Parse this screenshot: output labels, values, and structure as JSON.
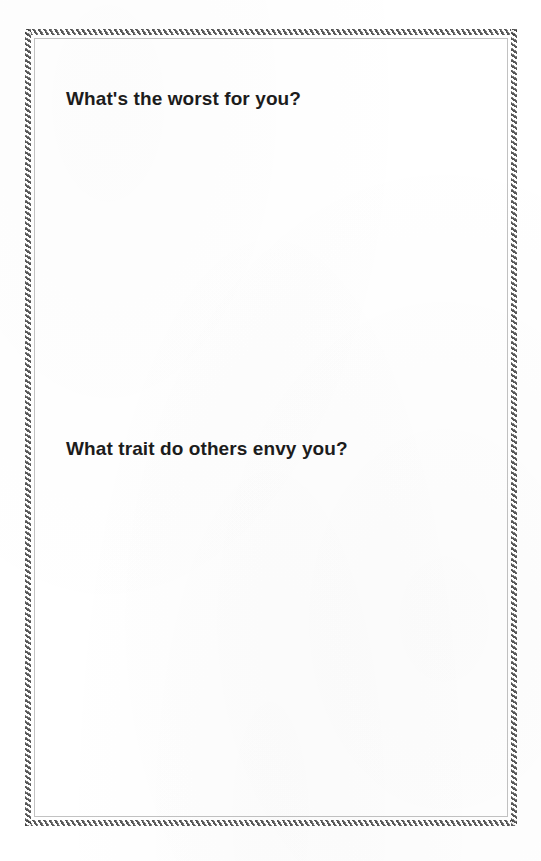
{
  "page": {
    "kind": "printable-journal-prompt-page",
    "background_color": "#ffffff",
    "width": 541,
    "height": 861
  },
  "frame": {
    "style_name": "hatched-rope-border",
    "band_color": "#3f3f3f",
    "band_highlight_color": "#6e6e6e",
    "inner_rule_color": "#787878"
  },
  "prompts": [
    {
      "id": "prompt-1",
      "heading": "What's the worst for you?",
      "answer_space_label": ""
    },
    {
      "id": "prompt-2",
      "heading": "What trait do others envy you?",
      "answer_space_label": ""
    }
  ]
}
